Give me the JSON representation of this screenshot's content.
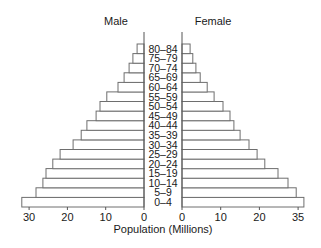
{
  "chart_data": {
    "type": "bar",
    "subtype": "population-pyramid",
    "title": "",
    "xlabel": "Population (Millions)",
    "ylabel": "",
    "categories": [
      "0–4",
      "5–9",
      "10–14",
      "15–19",
      "20–24",
      "25–29",
      "30–34",
      "35–39",
      "40–44",
      "45–49",
      "50–54",
      "55–59",
      "60–64",
      "65–69",
      "70–74",
      "75–79",
      "80–84"
    ],
    "series": [
      {
        "name": "Male",
        "side": "left",
        "values": [
          31.9,
          28.2,
          26.4,
          25.6,
          23.8,
          21.9,
          18.5,
          16.4,
          14.9,
          12.5,
          11.5,
          9.7,
          6.8,
          5.2,
          3.9,
          2.9,
          1.8
        ]
      },
      {
        "name": "Female",
        "side": "right",
        "values": [
          31.5,
          29.5,
          27.4,
          24.8,
          21.4,
          19.4,
          17.3,
          15.0,
          13.4,
          12.4,
          10.6,
          8.3,
          6.5,
          4.7,
          3.6,
          2.8,
          2.1
        ]
      }
    ],
    "male_ticks": [
      {
        "value": 0,
        "label": "0"
      },
      {
        "value": 10,
        "label": "10"
      },
      {
        "value": 20,
        "label": "20"
      },
      {
        "value": 30,
        "label": "30"
      }
    ],
    "female_ticks": [
      {
        "value": 0,
        "label": "0"
      },
      {
        "value": 10,
        "label": "10"
      },
      {
        "value": 20,
        "label": "20"
      },
      {
        "value": 30,
        "label": "35"
      }
    ],
    "xlim_male": [
      0,
      32
    ],
    "xlim_female": [
      0,
      32
    ],
    "grid": false,
    "legend": "none",
    "bar_fill": "#ffffff",
    "bar_stroke": "#6e6e6e"
  },
  "labels": {
    "male_title": "Male",
    "female_title": "Female",
    "xlabel": "Population (Millions)"
  }
}
